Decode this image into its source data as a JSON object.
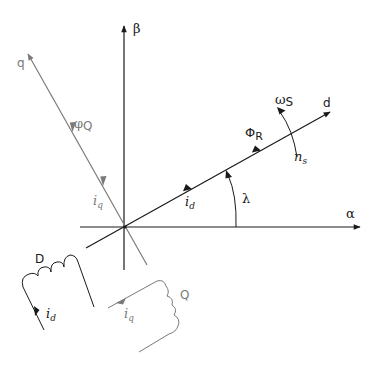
{
  "diagram": {
    "title": "",
    "colors": {
      "primary": "#1a1a1a",
      "secondary": "#7a7a7a",
      "background": "#ffffff"
    },
    "axes": {
      "alpha": {
        "label": "α"
      },
      "beta": {
        "label": "β"
      },
      "d": {
        "label": "d"
      },
      "q": {
        "label": "q"
      }
    },
    "vectors": {
      "flux_rotor": {
        "symbol": "Φ",
        "subscript": "R"
      },
      "flux_q": {
        "symbol": "φ",
        "subscript": "Q"
      },
      "current_d_axis": {
        "symbol": "i",
        "subscript": "d"
      },
      "current_q_axis": {
        "symbol": "i",
        "subscript": "q"
      }
    },
    "rotation": {
      "omega": {
        "symbol": "ω",
        "subscript": "S"
      },
      "speed": {
        "symbol": "n",
        "subscript": "s"
      }
    },
    "angle": {
      "label": "λ"
    },
    "windings": {
      "D": {
        "label": "D",
        "current_symbol": "i",
        "current_subscript": "d"
      },
      "Q": {
        "label": "Q",
        "current_symbol": "i",
        "current_subscript": "q"
      }
    }
  }
}
